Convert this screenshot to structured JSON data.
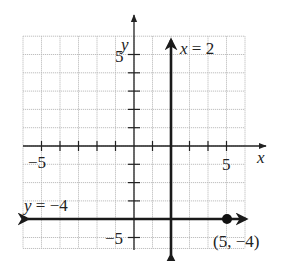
{
  "chart_data": {
    "type": "line",
    "title": "",
    "xlabel": "x",
    "ylabel": "y",
    "xlim": [
      -6,
      6
    ],
    "ylim": [
      -5.6,
      6
    ],
    "grid": true,
    "x_ticks": [
      -5,
      -4,
      -3,
      -2,
      -1,
      1,
      2,
      3,
      4,
      5
    ],
    "y_ticks": [
      -5,
      -4,
      -3,
      -2,
      -1,
      1,
      2,
      3,
      4,
      5
    ],
    "x_tick_labels": [
      "-5",
      "5"
    ],
    "y_tick_labels": [
      "5",
      "-5"
    ],
    "series": [
      {
        "name": "x = 2",
        "kind": "vertical-line",
        "x": 2,
        "arrows": "both"
      },
      {
        "name": "y = -4",
        "kind": "horizontal-line",
        "y": -4,
        "arrows": "both"
      }
    ],
    "points": [
      {
        "x": 5,
        "y": -4,
        "label": "(5, −4)"
      }
    ],
    "annotations": [
      {
        "text": "x = 2",
        "near": "top of vertical line"
      },
      {
        "text": "y = −4",
        "near": "left end of horizontal line"
      },
      {
        "text": "(5, −4)",
        "near": "point (5,-4)"
      }
    ]
  },
  "labels": {
    "x_axis": "x",
    "y_axis": "y",
    "x_tick_neg5": "−5",
    "x_tick_5": "5",
    "y_tick_5": "5",
    "y_tick_neg5": "−5",
    "vline_label_var": "x",
    "vline_label_rest": " = 2",
    "hline_label_var": "y",
    "hline_label_rest": " = −4",
    "point_label": "(5, −4)"
  },
  "colors": {
    "grid": "#b8b8b8",
    "axis": "#222222",
    "line": "#1a1a1a",
    "point": "#111111"
  }
}
